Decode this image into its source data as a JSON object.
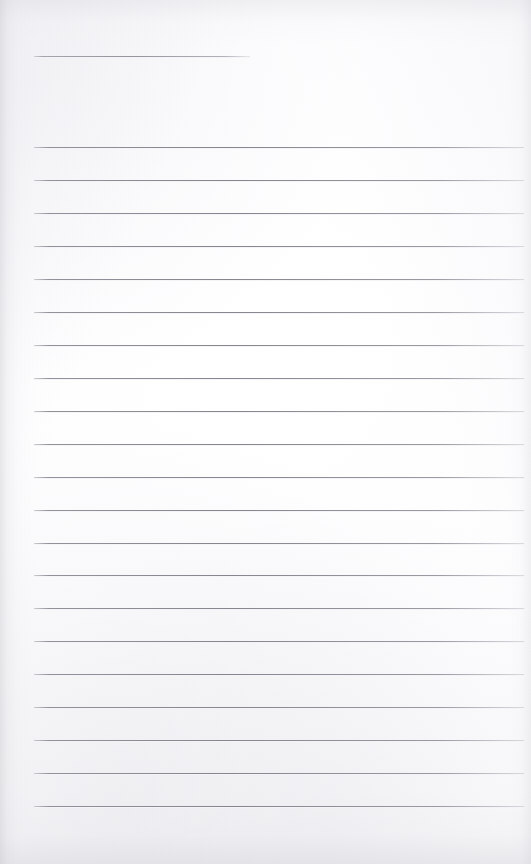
{
  "document": {
    "kind": "scanned-lined-page",
    "title": "Blank Lined Page",
    "page_width": 531,
    "page_height": 864,
    "paper_color": "#fdfdfe",
    "rule_color": "#8c8c94",
    "has_text_content": false,
    "written_content": ""
  },
  "header_rule": {
    "name": "header-rule",
    "x_start": 34,
    "x_end": 250,
    "y": 56,
    "thickness": 1
  },
  "body_rules": {
    "name": "body-ruled-lines",
    "count": 21,
    "x_start": 34,
    "x_end": 524,
    "first_y": 147,
    "spacing": 33,
    "thickness": 1,
    "y_positions": [
      147,
      180,
      213,
      246,
      279,
      312,
      345,
      378,
      411,
      444,
      477,
      510,
      543,
      575,
      608,
      641,
      674,
      707,
      740,
      773,
      806
    ]
  },
  "lines_text": [
    "",
    "",
    "",
    "",
    "",
    "",
    "",
    "",
    "",
    "",
    "",
    "",
    "",
    "",
    "",
    "",
    "",
    "",
    "",
    "",
    ""
  ]
}
